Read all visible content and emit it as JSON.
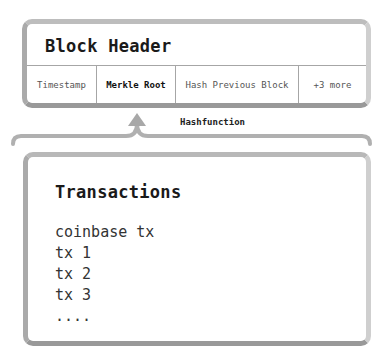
{
  "header": {
    "title": "Block Header",
    "fields": [
      {
        "label": "Timestamp",
        "emphasized": false
      },
      {
        "label": "Merkle Root",
        "emphasized": true
      },
      {
        "label": "Hash Previous Block",
        "emphasized": false
      },
      {
        "label": "+3 more",
        "emphasized": false
      }
    ]
  },
  "connector": {
    "label": "Hashfunction",
    "arrow_icon": "arrow-up-icon"
  },
  "transactions": {
    "title": "Transactions",
    "items": [
      "coinbase tx",
      "tx 1",
      "tx 2",
      "tx 3",
      "...."
    ]
  },
  "colors": {
    "border": "#bdbdbd",
    "connector": "#b0b0b0",
    "text": "#1a1a1a"
  }
}
